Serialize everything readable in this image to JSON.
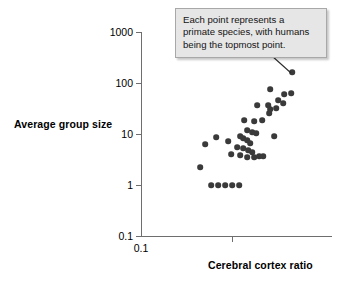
{
  "chart_data": {
    "type": "scatter",
    "title": "",
    "xlabel": "Cerebral cortex ratio",
    "ylabel": "Average group size",
    "xscale": "log",
    "yscale": "log",
    "x_tick_labels": [
      "0.1"
    ],
    "y_tick_labels": [
      "1000",
      "100",
      "10",
      "1",
      "0.1"
    ],
    "ylim": [
      0.1,
      1000
    ],
    "grid": false,
    "legend": null,
    "annotations": [
      {
        "name": "callout",
        "text": "Each point represents a\nprimate species, with humans\nbeing the topmost point.",
        "points_to": "topmost-data-point"
      }
    ],
    "point_color": "#3a3a3a",
    "points": [
      {
        "px": 292,
        "py": 72,
        "x": 4.1,
        "y": 150,
        "label": "humans"
      },
      {
        "px": 270,
        "py": 89,
        "x": 3.0,
        "y": 65
      },
      {
        "px": 284,
        "py": 94,
        "x": 3.6,
        "y": 48
      },
      {
        "px": 291,
        "py": 93,
        "x": 4.0,
        "y": 52
      },
      {
        "px": 278,
        "py": 100,
        "x": 3.3,
        "y": 36
      },
      {
        "px": 283,
        "py": 103,
        "x": 3.5,
        "y": 31
      },
      {
        "px": 268,
        "py": 105,
        "x": 2.9,
        "y": 28
      },
      {
        "px": 270,
        "py": 109,
        "x": 3.0,
        "y": 24
      },
      {
        "px": 276,
        "py": 108,
        "x": 3.2,
        "y": 25
      },
      {
        "px": 269,
        "py": 113,
        "x": 2.9,
        "y": 20
      },
      {
        "px": 257,
        "py": 105,
        "x": 2.4,
        "y": 28
      },
      {
        "px": 254,
        "py": 121,
        "x": 2.3,
        "y": 14
      },
      {
        "px": 262,
        "py": 120,
        "x": 2.6,
        "y": 15
      },
      {
        "px": 244,
        "py": 120,
        "x": 1.95,
        "y": 15
      },
      {
        "px": 247,
        "py": 130,
        "x": 2.05,
        "y": 9.5
      },
      {
        "px": 252,
        "py": 132,
        "x": 2.25,
        "y": 8.8
      },
      {
        "px": 256,
        "py": 133,
        "x": 2.4,
        "y": 8.5
      },
      {
        "px": 240,
        "py": 136,
        "x": 1.85,
        "y": 7.5
      },
      {
        "px": 243,
        "py": 138,
        "x": 1.9,
        "y": 7.0
      },
      {
        "px": 247,
        "py": 140,
        "x": 2.05,
        "y": 6.5
      },
      {
        "px": 250,
        "py": 143,
        "x": 2.2,
        "y": 5.8
      },
      {
        "px": 274,
        "py": 136,
        "x": 3.1,
        "y": 7.6
      },
      {
        "px": 228,
        "py": 141,
        "x": 1.5,
        "y": 6.2
      },
      {
        "px": 216,
        "py": 137,
        "x": 1.25,
        "y": 7.2
      },
      {
        "px": 237,
        "py": 147,
        "x": 1.8,
        "y": 5.0
      },
      {
        "px": 243,
        "py": 148,
        "x": 1.9,
        "y": 4.8
      },
      {
        "px": 248,
        "py": 150,
        "x": 2.1,
        "y": 4.4
      },
      {
        "px": 252,
        "py": 152,
        "x": 2.25,
        "y": 4.1
      },
      {
        "px": 240,
        "py": 155,
        "x": 1.85,
        "y": 3.7
      },
      {
        "px": 247,
        "py": 157,
        "x": 2.05,
        "y": 3.4
      },
      {
        "px": 254,
        "py": 157,
        "x": 2.35,
        "y": 3.4
      },
      {
        "px": 259,
        "py": 156,
        "x": 2.5,
        "y": 3.5
      },
      {
        "px": 263,
        "py": 156,
        "x": 2.7,
        "y": 3.5
      },
      {
        "px": 231,
        "py": 154,
        "x": 1.6,
        "y": 3.8
      },
      {
        "px": 205,
        "py": 144,
        "x": 1.0,
        "y": 5.2
      },
      {
        "px": 200,
        "py": 167,
        "x": 0.92,
        "y": 2.1
      },
      {
        "px": 211,
        "py": 185,
        "x": 1.15,
        "y": 1.0
      },
      {
        "px": 218,
        "py": 185,
        "x": 1.3,
        "y": 1.0
      },
      {
        "px": 225,
        "py": 185,
        "x": 1.45,
        "y": 1.0
      },
      {
        "px": 232,
        "py": 185,
        "x": 1.62,
        "y": 1.0
      },
      {
        "px": 239,
        "py": 185,
        "x": 1.82,
        "y": 1.0
      }
    ]
  },
  "axis": {
    "y_ticks": [
      {
        "label": "1000",
        "py": 32
      },
      {
        "label": "100",
        "py": 83
      },
      {
        "label": "10",
        "py": 134
      },
      {
        "label": "1",
        "py": 185
      },
      {
        "label": "0.1",
        "py": 236
      }
    ],
    "x_ticks": [
      {
        "label": "0.1",
        "px": 232
      }
    ],
    "x_origin_label": "0.1"
  }
}
